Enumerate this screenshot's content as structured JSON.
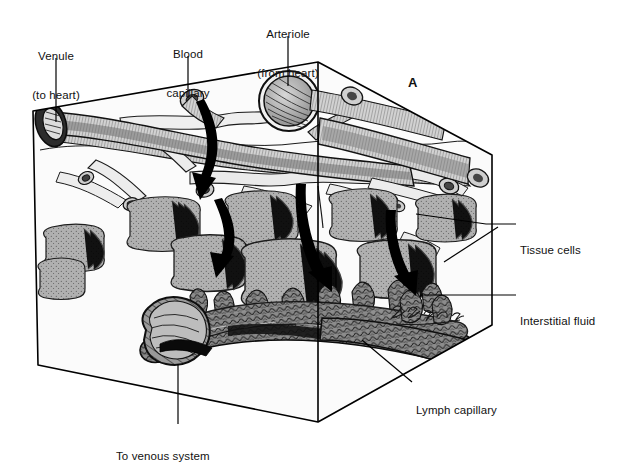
{
  "figure": {
    "panel_letter": "A",
    "artist_signature": "signature",
    "background_color": "#ffffff",
    "box_fill": "#fbfbfb",
    "line_color": "#000000",
    "tissue_cell_color": "#a8a8a8",
    "vessel_color": "#c9c9c9",
    "lymph_color": "#6e6e6e"
  },
  "labels": [
    {
      "id": "venule",
      "line1": "Venule",
      "line2": "(to heart)",
      "x": 56,
      "y": 30,
      "align": "center"
    },
    {
      "id": "blood-capillary",
      "line1": "Blood",
      "line2": "capillary",
      "x": 188,
      "y": 28,
      "align": "center"
    },
    {
      "id": "arteriole",
      "line1": "Arteriole",
      "line2": "(from heart)",
      "x": 288,
      "y": 8,
      "align": "center"
    },
    {
      "id": "tissue-cells",
      "line1": "Tissue cells",
      "line2": "",
      "x": 520,
      "y": 219,
      "align": "left"
    },
    {
      "id": "interstitial-fluid",
      "line1": "Interstitial fluid",
      "line2": "",
      "x": 520,
      "y": 290,
      "align": "left"
    },
    {
      "id": "lymph-capillary",
      "line1": "Lymph capillary",
      "line2": "",
      "x": 416,
      "y": 385,
      "align": "left"
    },
    {
      "id": "to-venous-system",
      "line1": "To venous system",
      "line2": "",
      "x": 116,
      "y": 429,
      "align": "left"
    }
  ],
  "panel": {
    "letter": "A",
    "x": 408,
    "y": 78
  },
  "structures": {
    "venule": "venule-tube",
    "arteriole": "arteriole-cross-section",
    "blood_capillary": "capillary-network",
    "tissue_cells": "tissue-cell-cluster",
    "lymph_capillary": "lymph-vessel",
    "interstitial_fluid": "interstitial-space"
  },
  "arrows": [
    {
      "id": "arrow-capillary-to-tissue",
      "desc": "fluid-out-of-blood-capillary"
    },
    {
      "id": "arrow-tissue-down",
      "desc": "fluid-into-interstitial-space"
    },
    {
      "id": "arrow-into-lymph-front",
      "desc": "fluid-into-lymph-capillary"
    },
    {
      "id": "arrow-into-lymph-back",
      "desc": "fluid-into-lymph-capillary-right"
    }
  ]
}
